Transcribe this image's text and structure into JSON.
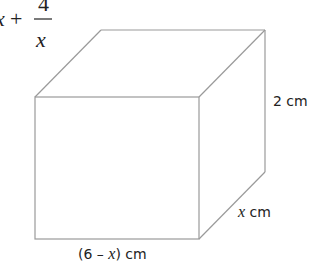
{
  "formula": {
    "prefix": "x",
    "plus": "+",
    "numerator": "4",
    "denominator": "x"
  },
  "cuboid": {
    "height_label": "2 cm",
    "depth_label_var": "x",
    "depth_label_unit": " cm",
    "width_label_open": "(6 – ",
    "width_label_var": "x",
    "width_label_close": ") cm"
  },
  "colors": {
    "edge": "#9a9a9a",
    "text": "#222222"
  }
}
